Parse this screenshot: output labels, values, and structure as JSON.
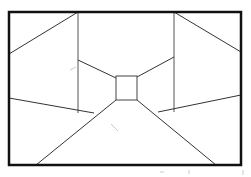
{
  "diagram": {
    "title": "",
    "colors": {
      "frame": "#111111",
      "lines": "#333333",
      "background": "#ffffff"
    },
    "frame": {
      "x": 9,
      "y": 12,
      "width": 232,
      "height": 153
    },
    "vanishing_square": {
      "x": 116,
      "y": 76,
      "width": 21,
      "height": 24
    },
    "vertical_lines": [
      {
        "name": "left-wall-edge",
        "x": 78,
        "y1": 12,
        "y2": 113
      },
      {
        "name": "right-wall-edge",
        "x": 174,
        "y1": 12,
        "y2": 112
      }
    ],
    "lines": [
      {
        "name": "top-left-diagonal",
        "x1": 78,
        "y1": 12,
        "x2": 9,
        "y2": 54
      },
      {
        "name": "top-right-diagonal",
        "x1": 174,
        "y1": 12,
        "x2": 241,
        "y2": 52
      },
      {
        "name": "ceiling-left",
        "x1": 78,
        "y1": 60,
        "x2": 116,
        "y2": 78
      },
      {
        "name": "ceiling-right",
        "x1": 174,
        "y1": 57,
        "x2": 137,
        "y2": 77
      },
      {
        "name": "floor-left-diagonal",
        "x1": 116,
        "y1": 100,
        "x2": 36,
        "y2": 165
      },
      {
        "name": "floor-right-diagonal",
        "x1": 137,
        "y1": 100,
        "x2": 216,
        "y2": 165
      },
      {
        "name": "lower-left-wall",
        "x1": 9,
        "y1": 98,
        "x2": 94,
        "y2": 113
      },
      {
        "name": "lower-right-wall",
        "x1": 241,
        "y1": 95,
        "x2": 158,
        "y2": 112
      }
    ],
    "labels": []
  }
}
